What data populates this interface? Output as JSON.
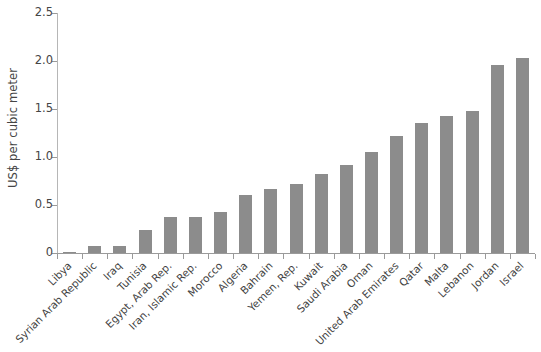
{
  "chart_data": {
    "type": "bar",
    "title": "",
    "xlabel": "",
    "ylabel": "US$ per cubic meter",
    "ylim": [
      0,
      2.5
    ],
    "ytick_labels": [
      "0",
      "0.5",
      "1.0",
      "1.5",
      "2.0",
      "2.5"
    ],
    "ytick_values": [
      0,
      0.5,
      1.0,
      1.5,
      2.0,
      2.5
    ],
    "grid": false,
    "legend": null,
    "bar_color": "#8c8c8c",
    "categories": [
      "Libya",
      "Syrian Arab Republic",
      "Iraq",
      "Tunisia",
      "Egypt, Arab Rep.",
      "Iran, Islamic Rep.",
      "Morocco",
      "Algeria",
      "Bahrain",
      "Yemen, Rep.",
      "Kuwait",
      "Saudi Arabia",
      "Oman",
      "United Arab Emirates",
      "Qatar",
      "Malta",
      "Lebanon",
      "Jordan",
      "Israel"
    ],
    "values": [
      0.01,
      0.07,
      0.07,
      0.24,
      0.37,
      0.38,
      0.43,
      0.6,
      0.67,
      0.72,
      0.82,
      0.92,
      1.05,
      1.22,
      1.35,
      1.43,
      1.48,
      1.96,
      2.03
    ]
  }
}
